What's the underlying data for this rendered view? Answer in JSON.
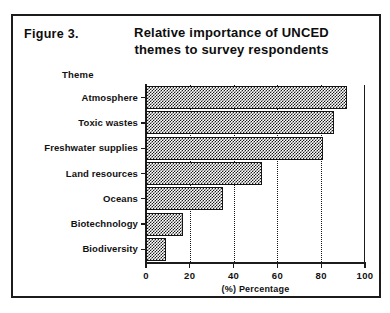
{
  "figure": {
    "number_label": "Figure 3.",
    "title_line1": "Relative importance of UNCED",
    "title_line2": "themes to survey respondents"
  },
  "chart_data": {
    "type": "bar",
    "orientation": "horizontal",
    "title": "Relative importance of UNCED themes to survey respondents",
    "xlabel": "(%) Percentage",
    "ylabel": "Theme",
    "categories": [
      "Atmosphere",
      "Toxic wastes",
      "Freshwater supplies",
      "Land resources",
      "Oceans",
      "Biotechnology",
      "Biodiversity"
    ],
    "values": [
      92,
      86,
      81,
      53,
      35,
      17,
      9
    ],
    "xlim": [
      0,
      100
    ],
    "xticks": [
      0,
      20,
      40,
      60,
      80,
      100
    ],
    "xtick_labels": [
      "0",
      "20",
      "40",
      "60",
      "80",
      "100"
    ],
    "grid": "vertical-dotted",
    "legend": "none",
    "bar_fill": "checkerboard-hatch",
    "colors": {
      "bar_outline": "#141414",
      "bar_pattern": "#1a1a1a",
      "axis": "#1c1c1c",
      "text": "#111111",
      "background": "#ffffff",
      "frame": "#1c1c1c"
    }
  }
}
